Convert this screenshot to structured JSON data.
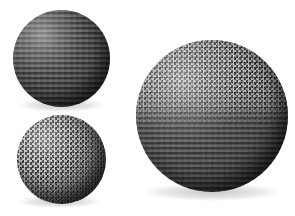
{
  "scene": {
    "title": "Procedurally textured spheres",
    "width": 295,
    "height": 216,
    "background_color": "#ffffff",
    "light_direction": "upper-left",
    "object_count": 3
  },
  "palette": {
    "background": "#ffffff",
    "sphere_base": "#4a4a4a",
    "shadow": "#000000",
    "highlight": "#ffffff"
  },
  "objects": [
    {
      "id": "sphere-striped",
      "label": "Striped sphere",
      "texture": "horizontal-stripes",
      "position": "top-left",
      "center_x": 61,
      "center_y": 58,
      "diameter": 97,
      "shading": "diffuse"
    },
    {
      "id": "sphere-checker",
      "label": "Checkerboard sphere",
      "texture": "checkerboard",
      "position": "bottom-left",
      "center_x": 61,
      "center_y": 159,
      "diameter": 89,
      "shading": "diffuse"
    },
    {
      "id": "sphere-combined",
      "label": "Combined texture sphere",
      "texture": "checkerboard-over-stripes",
      "position": "right",
      "center_x": 212,
      "center_y": 116,
      "diameter": 152,
      "shading": "diffuse"
    }
  ]
}
